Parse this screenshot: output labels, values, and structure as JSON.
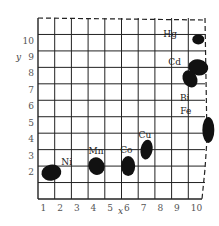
{
  "diagram": {
    "x_axis_label": "x",
    "y_axis_label": "y",
    "x_ticks": [
      "1",
      "2",
      "3",
      "4",
      "5",
      "6",
      "7",
      "8",
      "9",
      "10"
    ],
    "y_ticks": [
      "2",
      "3",
      "4",
      "5",
      "6",
      "7",
      "8",
      "9",
      "10"
    ],
    "grid_columns": 10,
    "grid_rows": 11,
    "ink_color": "#111111",
    "grid_color": "#222222",
    "elements": [
      {
        "symbol": "Ni",
        "x": 1.3,
        "y": 1.6
      },
      {
        "symbol": "Mn",
        "x": 4.0,
        "y": 2.0
      },
      {
        "symbol": "Co",
        "x": 5.9,
        "y": 2.0
      },
      {
        "symbol": "Cu",
        "x": 7.0,
        "y": 3.0
      },
      {
        "symbol": "Hg",
        "x": 10.1,
        "y": 9.7
      },
      {
        "symbol": "Cd",
        "x": 10.1,
        "y": 8.0
      },
      {
        "symbol": "Bi",
        "x": 9.6,
        "y": 7.3
      },
      {
        "symbol": "Fe",
        "x": 10.7,
        "y": 4.2
      }
    ]
  }
}
